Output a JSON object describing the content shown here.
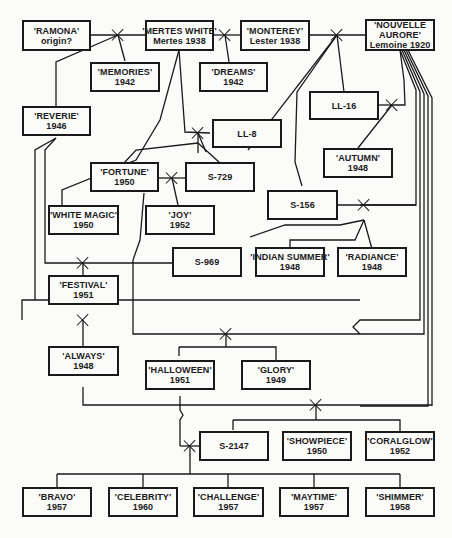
{
  "diagram": {
    "type": "pedigree",
    "nodes": [
      {
        "id": "ramona",
        "name": "'RAMONA'",
        "info": "origin?"
      },
      {
        "id": "mertes_white",
        "name": "'MERTES WHITE'",
        "info": "Mertes 1938"
      },
      {
        "id": "monterey",
        "name": "'MONTEREY'",
        "info": "Lester 1938"
      },
      {
        "id": "nouvelle_aurore",
        "name": "'NOUVELLE",
        "name2": "AURORE'",
        "info": "Lemoine 1920"
      },
      {
        "id": "memories",
        "name": "'MEMORIES'",
        "info": "1942"
      },
      {
        "id": "dreams",
        "name": "'DREAMS'",
        "info": "1942"
      },
      {
        "id": "reverie",
        "name": "'REVERIE'",
        "info": "1946"
      },
      {
        "id": "ll16",
        "name": "LL-16",
        "info": ""
      },
      {
        "id": "ll8",
        "name": "LL-8",
        "info": ""
      },
      {
        "id": "autumn",
        "name": "'AUTUMN'",
        "info": "1948"
      },
      {
        "id": "fortune",
        "name": "'FORTUNE'",
        "info": "1950"
      },
      {
        "id": "s729",
        "name": "S-729",
        "info": ""
      },
      {
        "id": "s156",
        "name": "S-156",
        "info": ""
      },
      {
        "id": "white_magic",
        "name": "'WHITE MAGIC'",
        "info": "1950"
      },
      {
        "id": "joy",
        "name": "'JOY'",
        "info": "1952"
      },
      {
        "id": "s969",
        "name": "S-969",
        "info": ""
      },
      {
        "id": "indian_summer",
        "name": "'INDIAN SUMMER'",
        "info": "1948"
      },
      {
        "id": "radiance",
        "name": "'RADIANCE'",
        "info": "1948"
      },
      {
        "id": "festival",
        "name": "'FESTIVAL'",
        "info": "1951"
      },
      {
        "id": "always",
        "name": "'ALWAYS'",
        "info": "1948"
      },
      {
        "id": "halloween",
        "name": "'HALLOWEEN'",
        "info": "1951"
      },
      {
        "id": "glory",
        "name": "'GLORY'",
        "info": "1949"
      },
      {
        "id": "s2147",
        "name": "S-2147",
        "info": ""
      },
      {
        "id": "showpiece",
        "name": "'SHOWPIECE'",
        "info": "1950"
      },
      {
        "id": "coralglow",
        "name": "'CORALGLOW'",
        "info": "1952"
      },
      {
        "id": "bravo",
        "name": "'BRAVO'",
        "info": "1957"
      },
      {
        "id": "celebrity",
        "name": "'CELEBRITY'",
        "info": "1960"
      },
      {
        "id": "challenge",
        "name": "'CHALLENGE'",
        "info": "1957"
      },
      {
        "id": "maytime",
        "name": "'MAYTIME'",
        "info": "1957"
      },
      {
        "id": "shimmer",
        "name": "'SHIMMER'",
        "info": "1958"
      }
    ],
    "crosses": [
      {
        "parents": [
          "RAMONA",
          "MERTES WHITE"
        ],
        "offspring": [
          "MEMORIES",
          "REVERIE"
        ]
      },
      {
        "parents": [
          "MERTES WHITE",
          "MONTEREY"
        ],
        "offspring": [
          "DREAMS"
        ]
      },
      {
        "parents": [
          "MONTEREY",
          "NOUVELLE AURORE"
        ],
        "offspring": [
          "LL-16",
          "LL-8",
          "S-156"
        ]
      },
      {
        "parents": [
          "LL-16",
          "NOUVELLE AURORE"
        ],
        "offspring": [
          "AUTUMN"
        ]
      },
      {
        "parents": [
          "MERTES WHITE",
          "LL-8"
        ],
        "offspring": [
          "FORTUNE",
          "S-729"
        ]
      },
      {
        "parents": [
          "REVERIE",
          "FORTUNE"
        ],
        "offspring": [
          "WHITE MAGIC"
        ]
      },
      {
        "parents": [
          "FORTUNE",
          "S-729"
        ],
        "offspring": [
          "JOY"
        ]
      },
      {
        "parents": [
          "S-156",
          "NOUVELLE AURORE"
        ],
        "offspring": [
          "S-969",
          "INDIAN SUMMER",
          "RADIANCE"
        ]
      },
      {
        "parents": [
          "REVERIE",
          "S-969"
        ],
        "offspring": [
          "FESTIVAL"
        ]
      },
      {
        "parents": [
          "REVERIE",
          "NOUVELLE AURORE"
        ],
        "offspring": [
          "ALWAYS"
        ]
      },
      {
        "parents": [
          "FORTUNE",
          "NOUVELLE AURORE"
        ],
        "offspring": [
          "HALLOWEEN",
          "GLORY"
        ]
      },
      {
        "parents": [
          "ALWAYS",
          "NOUVELLE AURORE"
        ],
        "offspring": [
          "S-2147",
          "SHOWPIECE",
          "CORALGLOW"
        ]
      },
      {
        "parents": [
          "HALLOWEEN",
          "S-2147"
        ],
        "offspring": [
          "BRAVO",
          "CELEBRITY",
          "CHALLENGE",
          "MAYTIME",
          "SHIMMER"
        ]
      }
    ]
  }
}
